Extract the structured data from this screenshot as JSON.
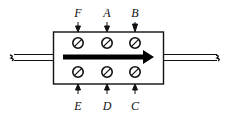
{
  "diagram": {
    "type": "pipe-section-with-measurement-points",
    "flow_direction": "left-to-right",
    "top_labels": [
      "F",
      "A",
      "B"
    ],
    "bottom_labels": [
      "E",
      "D",
      "C"
    ],
    "colors": {
      "stroke": "#111111",
      "background": "#ffffff",
      "arrow": "#000000"
    }
  }
}
